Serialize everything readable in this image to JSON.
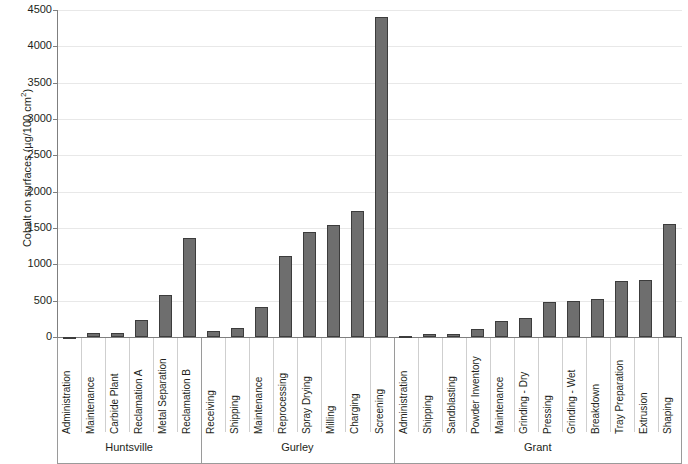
{
  "chart_data": {
    "type": "bar",
    "title": "",
    "subtitle": "",
    "xlabel": "",
    "ylabel": "Cobalt on surfaces (µg/100 cm²)",
    "ylabel_main": "Cobalt on surfaces (µg/100 cm",
    "ylabel_sup": "2",
    "ylabel_tail": ")",
    "ylim": [
      0,
      4500
    ],
    "ytick_step": 500,
    "ytick_labels": [
      "0",
      "500",
      "1000",
      "1500",
      "2000",
      "2500",
      "3000",
      "3500",
      "4000",
      "4500"
    ],
    "ytick_values": [
      0,
      500,
      1000,
      1500,
      2000,
      2500,
      3000,
      3500,
      4000,
      4500
    ],
    "grid": true,
    "grid_axis": "y",
    "legend": "none",
    "bar_color": "#6e6e6e",
    "bar_border_color": "#3c3c3c",
    "grid_color": "#e8e8e8",
    "axis_color": "#7f7f7f",
    "categories": [
      "Administration",
      "Maintenance",
      "Carbide Plant",
      "Reclamation A",
      "Metal Separation",
      "Reclamation B",
      "Receiving",
      "Shipping",
      "Maintenance",
      "Reprocessing",
      "Spray Drying",
      "Milling",
      "Charging",
      "Screening",
      "Administration",
      "Shipping",
      "Sandblasting",
      "Powder Inventory",
      "Maintenance",
      "Grinding - Dry",
      "Pressing",
      "Grinding - Wet",
      "Breakdown",
      "Tray Preparation",
      "Extrusion",
      "Shaping"
    ],
    "values": [
      5,
      55,
      60,
      235,
      580,
      1365,
      85,
      130,
      410,
      1110,
      1440,
      1540,
      1740,
      4400,
      15,
      45,
      45,
      110,
      215,
      255,
      485,
      495,
      520,
      775,
      780,
      1555
    ],
    "groups": [
      {
        "name": "Huntsville",
        "count": 6,
        "items": [
          {
            "label": "Administration",
            "value": 5
          },
          {
            "label": "Maintenance",
            "value": 55
          },
          {
            "label": "Carbide Plant",
            "value": 60
          },
          {
            "label": "Reclamation A",
            "value": 235
          },
          {
            "label": "Metal Separation",
            "value": 580
          },
          {
            "label": "Reclamation B",
            "value": 1365
          }
        ]
      },
      {
        "name": "Gurley",
        "count": 8,
        "items": [
          {
            "label": "Receiving",
            "value": 85
          },
          {
            "label": "Shipping",
            "value": 130
          },
          {
            "label": "Maintenance",
            "value": 410
          },
          {
            "label": "Reprocessing",
            "value": 1110
          },
          {
            "label": "Spray Drying",
            "value": 1440
          },
          {
            "label": "Milling",
            "value": 1540
          },
          {
            "label": "Charging",
            "value": 1740
          },
          {
            "label": "Screening",
            "value": 4400
          }
        ]
      },
      {
        "name": "Grant",
        "count": 12,
        "items": [
          {
            "label": "Administration",
            "value": 15
          },
          {
            "label": "Shipping",
            "value": 45
          },
          {
            "label": "Sandblasting",
            "value": 45
          },
          {
            "label": "Powder Inventory",
            "value": 110
          },
          {
            "label": "Maintenance",
            "value": 215
          },
          {
            "label": "Grinding - Dry",
            "value": 255
          },
          {
            "label": "Pressing",
            "value": 485
          },
          {
            "label": "Grinding - Wet",
            "value": 495
          },
          {
            "label": "Breakdown",
            "value": 520
          },
          {
            "label": "Tray Preparation",
            "value": 775
          },
          {
            "label": "Extrusion",
            "value": 780
          },
          {
            "label": "Shaping",
            "value": 1555
          }
        ]
      }
    ]
  }
}
